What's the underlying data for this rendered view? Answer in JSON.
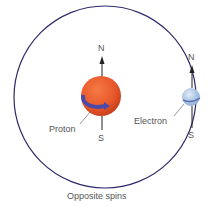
{
  "diagram": {
    "caption": "Opposite spins",
    "proton": {
      "label": "Proton",
      "north": "N",
      "south": "S",
      "color": "#e8572a"
    },
    "electron": {
      "label": "Electron",
      "north": "N",
      "south": "S",
      "color": "#a9c4e4"
    },
    "orbit_color": "#2e2a6b",
    "spin_arrow_color": "#4a4aa8"
  }
}
